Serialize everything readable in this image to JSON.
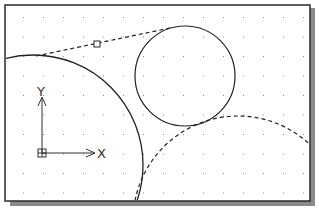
{
  "drawing": {
    "frame": {
      "x": 5,
      "y": 5,
      "width": 305,
      "height": 196,
      "border_color": "#2a2a2a",
      "shadow_color": "#8a8a8a"
    },
    "grid": {
      "x0": 23,
      "y0": 17,
      "dx": 20,
      "dy": 19.5,
      "cols": 15,
      "rows": 10,
      "dot_color": "#8c8c8c"
    },
    "ucs_icon": {
      "origin": [
        42,
        153
      ],
      "x_axis_label": "X",
      "y_axis_label": "Y"
    },
    "entities": [
      {
        "type": "circle",
        "name": "large-circle",
        "cx": 33,
        "cy": 165,
        "r": 110,
        "style": "solid"
      },
      {
        "type": "circle",
        "name": "small-circle",
        "cx": 185,
        "cy": 76,
        "r": 50,
        "style": "solid"
      },
      {
        "type": "arc",
        "name": "dashed-arc",
        "cx": 238,
        "cy": 221,
        "r": 105,
        "style": "dashed"
      },
      {
        "type": "line",
        "name": "dashed-tangent-line",
        "x1": 36,
        "y1": 56,
        "x2": 170,
        "y2": 28,
        "style": "dashed"
      },
      {
        "type": "marker",
        "name": "snap-marker",
        "x": 97,
        "y": 44,
        "size": 6
      }
    ]
  }
}
